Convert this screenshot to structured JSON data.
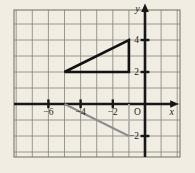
{
  "figure": {
    "width": 195,
    "height": 173,
    "colors": {
      "background": "#f1ede3",
      "grid_line": "#85827b",
      "frame": "#6f6c65",
      "axis": "#171717",
      "text": "#1d1d1d",
      "black_triangle": "#121212",
      "gray_hypotenuse": "#8e8e8e",
      "gray_vertical": "#b5b5b5",
      "gray_horizontal": "#8e8e8e"
    },
    "grid": {
      "frame_px": {
        "x": 14,
        "y": 10,
        "w": 166,
        "h": 147
      },
      "origin_px": {
        "x": 145,
        "y": 104
      },
      "cell_w": 16.1,
      "cell_h": 16.0,
      "x_min": -8,
      "x_max": 2,
      "y_min": -3,
      "y_max": 5
    },
    "axes": {
      "x_label": "x",
      "y_label": "y",
      "origin_label": "O",
      "x_ticks": [
        {
          "value": -6,
          "label": "−6"
        },
        {
          "value": -4,
          "label": "−4"
        },
        {
          "value": -2,
          "label": "−2"
        }
      ],
      "y_ticks": [
        {
          "value": 4,
          "label": "4"
        },
        {
          "value": 2,
          "label": "2"
        },
        {
          "value": -2,
          "label": "−2"
        }
      ]
    },
    "shapes": {
      "black_triangle": {
        "description": "bold outlined right triangle",
        "vertices": [
          [
            -5,
            2
          ],
          [
            -1,
            2
          ],
          [
            -1,
            4
          ]
        ]
      },
      "gray_triangle": {
        "description": "gray image triangle, top side lies on x-axis",
        "vertices": [
          [
            -5,
            0
          ],
          [
            -1,
            0
          ],
          [
            -1,
            -2
          ]
        ]
      }
    }
  }
}
